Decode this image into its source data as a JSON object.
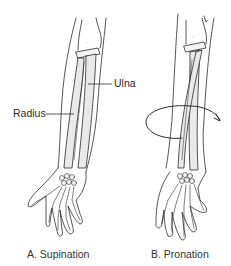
{
  "figure": {
    "panels": [
      {
        "id": "A",
        "caption": "A. Supination"
      },
      {
        "id": "B",
        "caption": "B. Pronation"
      }
    ],
    "labels": {
      "radius": "Radius",
      "ulna": "Ulna"
    },
    "colors": {
      "line": "#2b2b2b",
      "bone_fill": "#e2e2e2",
      "background": "#ffffff"
    }
  }
}
